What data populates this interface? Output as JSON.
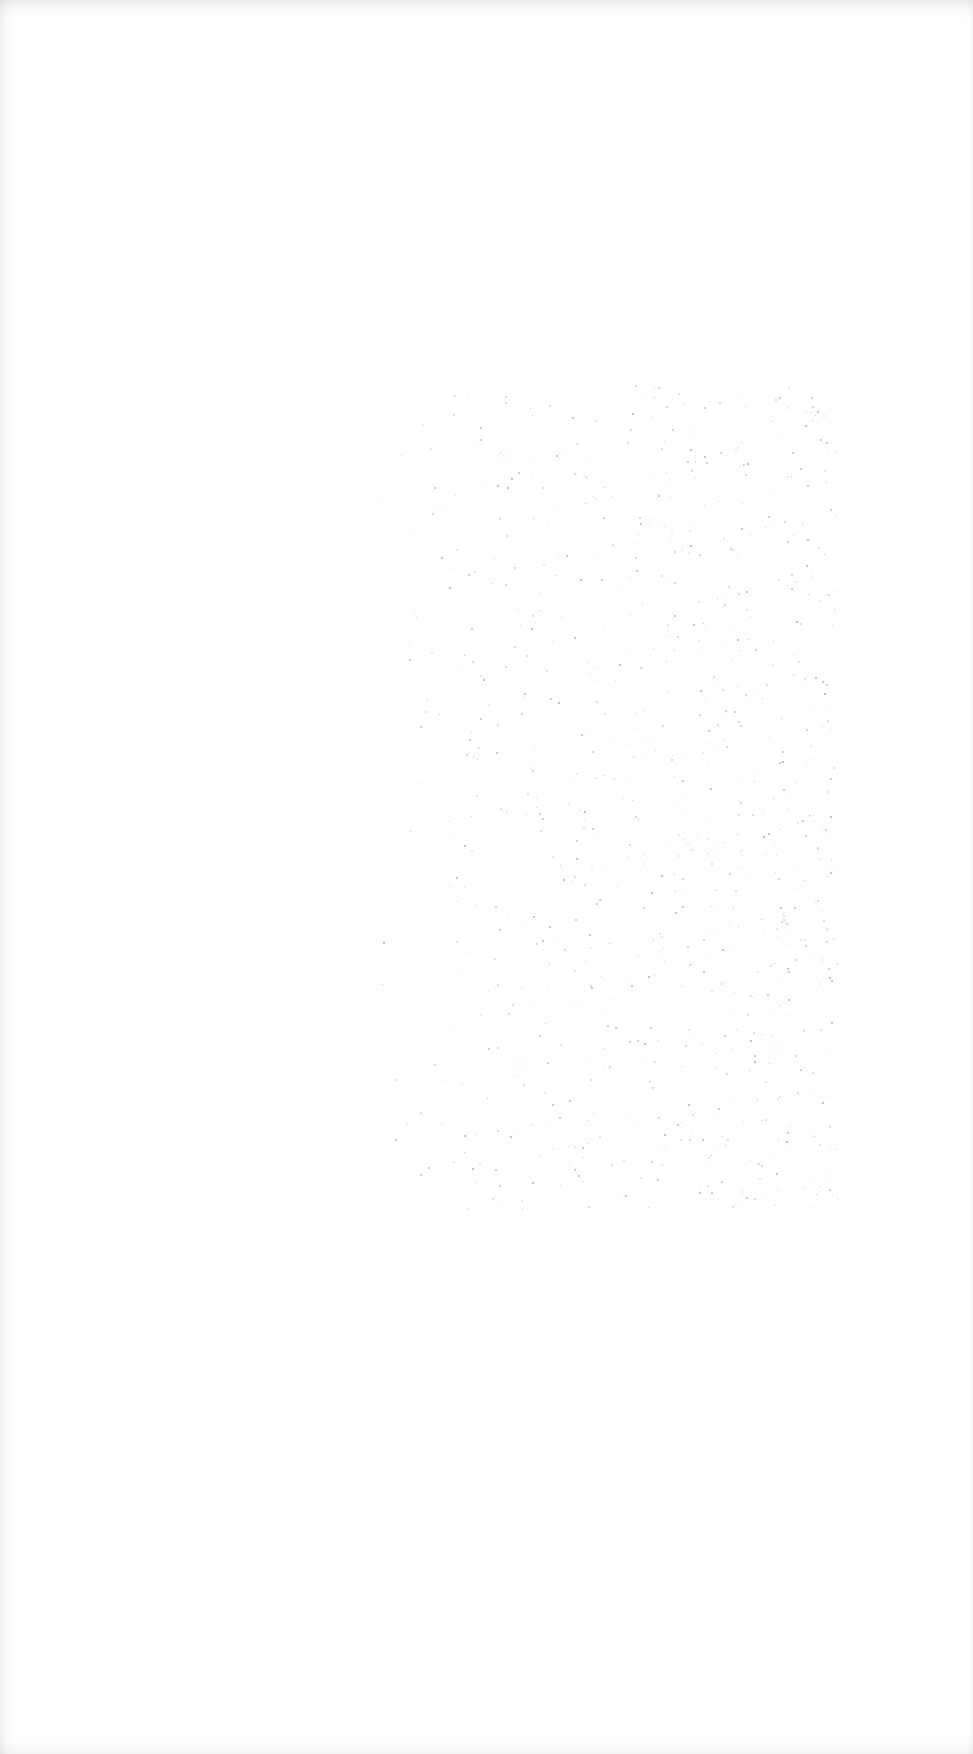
{
  "page": {
    "width": 973,
    "height": 1754,
    "background_color": "#ffffff",
    "edge_shading_color": "#e6e6e6"
  },
  "noise_region": {
    "x": 368,
    "y": 385,
    "width": 470,
    "height": 825,
    "speck_color": "#8a8a8a",
    "speck_count": 900,
    "density_bias": "heavier toward right side"
  },
  "text_content": []
}
